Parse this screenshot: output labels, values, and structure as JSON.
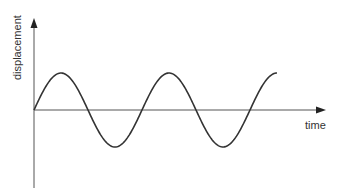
{
  "diagram": {
    "y_axis_label": "displacement",
    "x_axis_label": "time",
    "colors": {
      "axis": "#555555",
      "wave": "#333333",
      "text": "#333333"
    }
  },
  "chart_data": {
    "type": "line",
    "title": "",
    "xlabel": "time",
    "ylabel": "displacement",
    "series": [
      {
        "name": "sine wave",
        "description": "sinusoid starting at origin, ~2.25 cycles, ending at a peak",
        "x": [
          0,
          0.25,
          0.5,
          0.75,
          1.0,
          1.25,
          1.5,
          1.75,
          2.0,
          2.25
        ],
        "values": [
          0,
          1,
          0,
          -1,
          0,
          1,
          0,
          -1,
          0,
          1
        ]
      }
    ],
    "grid": false,
    "legend": false
  }
}
